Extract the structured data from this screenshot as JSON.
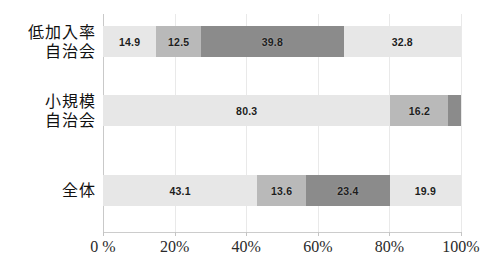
{
  "chart": {
    "type": "bar",
    "title": "",
    "subtitle": "",
    "xlabel": "",
    "ylabel": ""
  },
  "chart_data": {
    "type": "bar",
    "orientation": "horizontal",
    "stacked": true,
    "normalized": true,
    "title": "",
    "subtitle": "",
    "xlabel": "",
    "ylabel": "",
    "xlim": [
      0,
      100
    ],
    "xticks": [
      0,
      20,
      40,
      60,
      80,
      100
    ],
    "xtick_labels": [
      "0 %",
      "20%",
      "40%",
      "60%",
      "80%",
      "100%"
    ],
    "grid": "vertical-only",
    "legend": "none",
    "categories": [
      "低加入率自治会",
      "小規模自治会",
      "全体"
    ],
    "category_lines": [
      [
        "低加入率",
        "自治会"
      ],
      [
        "小規模",
        "自治会"
      ],
      [
        "全体"
      ]
    ],
    "series": [
      {
        "name": "series-1",
        "color": "#e7e7e7",
        "values": [
          14.9,
          80.3,
          43.1
        ]
      },
      {
        "name": "series-2",
        "color": "#b9b9b9",
        "values": [
          12.5,
          16.2,
          13.6
        ]
      },
      {
        "name": "series-3",
        "color": "#8b8b8b",
        "values": [
          39.8,
          3.5,
          23.4
        ]
      },
      {
        "name": "series-4",
        "color": "#e7e7e7",
        "values": [
          32.8,
          0.0,
          19.9
        ]
      }
    ],
    "rows": [
      {
        "label": "低加入率自治会",
        "segments": [
          {
            "value": 14.9,
            "label": "14.9",
            "shade": "light"
          },
          {
            "value": 12.5,
            "label": "12.5",
            "shade": "medium"
          },
          {
            "value": 39.8,
            "label": "39.8",
            "shade": "dark"
          },
          {
            "value": 32.8,
            "label": "32.8",
            "shade": "light"
          }
        ]
      },
      {
        "label": "小規模自治会",
        "segments": [
          {
            "value": 80.3,
            "label": "80.3",
            "shade": "light"
          },
          {
            "value": 16.2,
            "label": "16.2",
            "shade": "medium"
          },
          {
            "value": 3.5,
            "label": "",
            "shade": "dark"
          }
        ]
      },
      {
        "label": "全体",
        "segments": [
          {
            "value": 43.1,
            "label": "43.1",
            "shade": "light"
          },
          {
            "value": 13.6,
            "label": "13.6",
            "shade": "medium"
          },
          {
            "value": 23.4,
            "label": "23.4",
            "shade": "dark"
          },
          {
            "value": 19.9,
            "label": "19.9",
            "shade": "light"
          }
        ]
      }
    ]
  },
  "colors": {
    "light": "#e7e7e7",
    "medium": "#b9b9b9",
    "dark": "#8b8b8b",
    "gridline": "#e9e9e9",
    "axis": "#c9c9c9",
    "text": "#1d1d1d",
    "background": "#ffffff"
  },
  "axis": {
    "ticks": [
      {
        "value": 0,
        "label": "0 %"
      },
      {
        "value": 20,
        "label": "20%"
      },
      {
        "value": 40,
        "label": "40%"
      },
      {
        "value": 60,
        "label": "60%"
      },
      {
        "value": 80,
        "label": "80%"
      },
      {
        "value": 100,
        "label": "100%"
      }
    ]
  }
}
